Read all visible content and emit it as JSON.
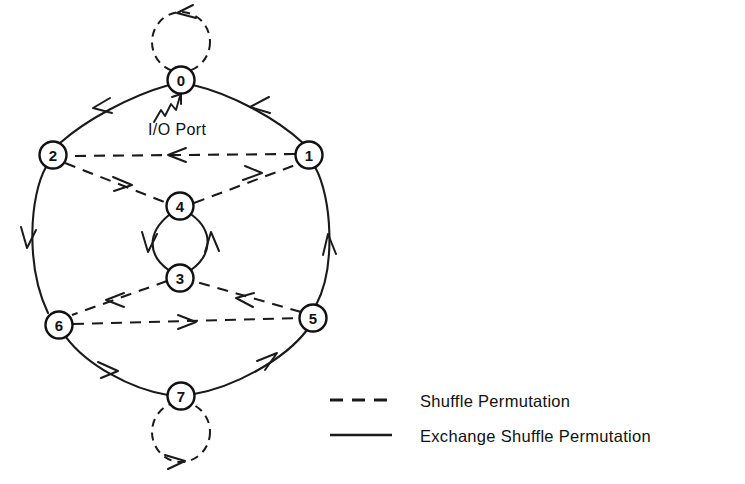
{
  "figure": {
    "io_port_label": "I/O Port",
    "node_count": 8
  },
  "nodes": [
    {
      "id": "0",
      "label": "0",
      "cx": 181,
      "cy": 80,
      "r": 13.5
    },
    {
      "id": "1",
      "label": "1",
      "cx": 309,
      "cy": 155,
      "r": 13.5
    },
    {
      "id": "2",
      "label": "2",
      "cx": 53,
      "cy": 155,
      "r": 13.5
    },
    {
      "id": "3",
      "label": "3",
      "cx": 180,
      "cy": 278,
      "r": 13.5
    },
    {
      "id": "4",
      "label": "4",
      "cx": 180,
      "cy": 206,
      "r": 13.5
    },
    {
      "id": "5",
      "label": "5",
      "cx": 313,
      "cy": 318,
      "r": 13.5
    },
    {
      "id": "6",
      "label": "6",
      "cx": 59,
      "cy": 325,
      "r": 13.5
    },
    {
      "id": "7",
      "label": "7",
      "cx": 181,
      "cy": 396,
      "r": 13.5
    }
  ],
  "edges": {
    "exchange_shuffle": [
      {
        "from": "0",
        "to": "2",
        "style": "solid"
      },
      {
        "from": "1",
        "to": "0",
        "style": "solid"
      },
      {
        "from": "2",
        "to": "6",
        "style": "solid"
      },
      {
        "from": "5",
        "to": "1",
        "style": "solid"
      },
      {
        "from": "6",
        "to": "7",
        "style": "solid"
      },
      {
        "from": "7",
        "to": "5",
        "style": "solid"
      },
      {
        "from": "4",
        "to": "3",
        "style": "solid"
      },
      {
        "from": "3",
        "to": "4",
        "style": "solid"
      }
    ],
    "shuffle": [
      {
        "from": "1",
        "to": "2",
        "style": "dashed"
      },
      {
        "from": "2",
        "to": "4",
        "style": "dashed"
      },
      {
        "from": "4",
        "to": "1",
        "style": "dashed"
      },
      {
        "from": "3",
        "to": "6",
        "style": "dashed"
      },
      {
        "from": "5",
        "to": "3",
        "style": "dashed"
      },
      {
        "from": "6",
        "to": "5",
        "style": "dashed"
      },
      {
        "from": "0",
        "to": "0",
        "style": "dashed",
        "self_loop": true
      },
      {
        "from": "7",
        "to": "7",
        "style": "dashed",
        "self_loop": true
      }
    ]
  },
  "legend": {
    "items": [
      {
        "key": "shuffle",
        "line_style": "dashed",
        "label": "Shuffle Permutation"
      },
      {
        "key": "exchange-shuffle",
        "line_style": "solid",
        "label": "Exchange Shuffle Permutation"
      }
    ]
  },
  "colors": {
    "ink": "#1a1a1a",
    "background": "#ffffff",
    "node_fill": "#ffffff"
  }
}
